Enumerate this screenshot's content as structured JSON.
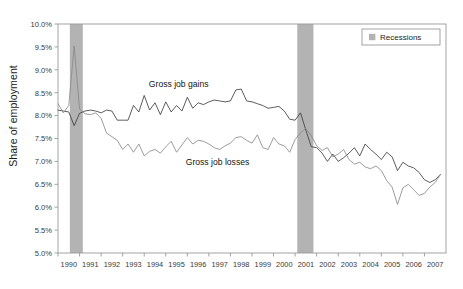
{
  "figure": {
    "title": "",
    "title_note": "chart title is cropped off the top edge of the screenshot",
    "background": "#ffffff"
  },
  "axis": {
    "ylabel": "Share of employment",
    "xlabel": ""
  },
  "legend": {
    "position": "top-right",
    "entries": [
      {
        "label": "Recessions",
        "swatch_color": "#b3b3b3"
      }
    ]
  },
  "annotations": [
    {
      "name": "gross-job-gains-label",
      "text": "Gross job gains",
      "x": 1995.6,
      "y": 8.62
    },
    {
      "name": "gross-job-losses-label",
      "text": "Gross job losses",
      "x": 1997.4,
      "y": 6.92
    }
  ],
  "colors": {
    "gains_line": "#404040",
    "losses_line": "#8a8a8a",
    "recession_band": "#b3b3b3",
    "frame": "#9a9a9a",
    "text": "#333333"
  },
  "chart_data": {
    "type": "line",
    "title": "",
    "xlabel": "",
    "ylabel": "Share of employment",
    "xlim": [
      1990.0,
      2008.0
    ],
    "ylim": [
      5.0,
      10.0
    ],
    "ytick_values": [
      5.0,
      5.5,
      6.0,
      6.5,
      7.0,
      7.5,
      8.0,
      8.5,
      9.0,
      9.5,
      10.0
    ],
    "ytick_labels": [
      "5.0%",
      "5.5%",
      "6.0%",
      "6.5%",
      "7.0%",
      "7.5%",
      "8.0%",
      "8.5%",
      "9.0%",
      "9.5%",
      "10.0%"
    ],
    "xtick_values": [
      1990,
      1991,
      1992,
      1993,
      1994,
      1995,
      1996,
      1997,
      1998,
      1999,
      2000,
      2001,
      2002,
      2003,
      2004,
      2005,
      2006,
      2007
    ],
    "xtick_labels": [
      "1990",
      "1991",
      "1992",
      "1993",
      "1994",
      "1995",
      "1996",
      "1997",
      "1998",
      "1999",
      "2000",
      "2001",
      "2002",
      "2003",
      "2004",
      "2005",
      "2006",
      "2007"
    ],
    "grid": false,
    "legend_position": "top-right",
    "bands": [
      {
        "name": "Recessions",
        "x_start": 1990.55,
        "x_end": 1991.15,
        "color": "#b3b3b3"
      },
      {
        "name": "Recessions",
        "x_start": 2001.1,
        "x_end": 2001.85,
        "color": "#b3b3b3"
      }
    ],
    "x": [
      1990.0,
      1990.25,
      1990.5,
      1990.75,
      1991.0,
      1991.25,
      1991.5,
      1991.75,
      1992.0,
      1992.25,
      1992.5,
      1992.75,
      1993.0,
      1993.25,
      1993.5,
      1993.75,
      1994.0,
      1994.25,
      1994.5,
      1994.75,
      1995.0,
      1995.25,
      1995.5,
      1995.75,
      1996.0,
      1996.25,
      1996.5,
      1996.75,
      1997.0,
      1997.25,
      1997.5,
      1997.75,
      1998.0,
      1998.25,
      1998.5,
      1998.75,
      1999.0,
      1999.25,
      1999.5,
      1999.75,
      2000.0,
      2000.25,
      2000.5,
      2000.75,
      2001.0,
      2001.25,
      2001.5,
      2001.75,
      2002.0,
      2002.25,
      2002.5,
      2002.75,
      2003.0,
      2003.25,
      2003.5,
      2003.75,
      2004.0,
      2004.25,
      2004.5,
      2004.75,
      2005.0,
      2005.25,
      2005.5,
      2005.75,
      2006.0,
      2006.25,
      2006.5,
      2006.75,
      2007.0,
      2007.25,
      2007.5,
      2007.75
    ],
    "series": [
      {
        "name": "Gross job gains",
        "color": "#404040",
        "values": [
          8.12,
          8.1,
          8.08,
          7.78,
          8.05,
          8.1,
          8.12,
          8.1,
          8.06,
          8.12,
          8.1,
          7.9,
          7.9,
          7.9,
          8.22,
          8.08,
          8.44,
          8.12,
          8.28,
          8.02,
          8.3,
          8.08,
          8.22,
          8.1,
          8.4,
          8.16,
          8.28,
          8.24,
          8.3,
          8.34,
          8.32,
          8.3,
          8.32,
          8.56,
          8.58,
          8.32,
          8.3,
          8.26,
          8.22,
          8.16,
          8.18,
          8.2,
          8.1,
          7.92,
          7.9,
          8.06,
          7.68,
          7.32,
          7.3,
          7.18,
          7.0,
          7.16,
          7.0,
          7.08,
          7.18,
          7.3,
          7.12,
          7.38,
          7.26,
          7.16,
          7.04,
          7.2,
          7.1,
          6.8,
          6.98,
          6.9,
          6.86,
          6.76,
          6.6,
          6.54,
          6.6,
          6.72
        ]
      },
      {
        "name": "Gross job losses",
        "color": "#8a8a8a",
        "values": [
          8.26,
          8.06,
          8.22,
          9.52,
          8.14,
          8.04,
          8.02,
          8.06,
          7.94,
          7.62,
          7.54,
          7.46,
          7.26,
          7.38,
          7.2,
          7.38,
          7.12,
          7.22,
          7.26,
          7.18,
          7.32,
          7.44,
          7.2,
          7.36,
          7.52,
          7.38,
          7.46,
          7.44,
          7.38,
          7.3,
          7.26,
          7.34,
          7.4,
          7.52,
          7.54,
          7.46,
          7.4,
          7.58,
          7.3,
          7.26,
          7.52,
          7.38,
          7.34,
          7.2,
          7.48,
          7.62,
          7.72,
          7.56,
          7.34,
          7.24,
          7.3,
          7.1,
          7.16,
          7.26,
          7.04,
          6.94,
          6.98,
          6.88,
          6.84,
          6.9,
          6.8,
          6.58,
          6.44,
          6.06,
          6.42,
          6.5,
          6.38,
          6.26,
          6.3,
          6.44,
          6.54,
          6.72
        ]
      }
    ]
  }
}
